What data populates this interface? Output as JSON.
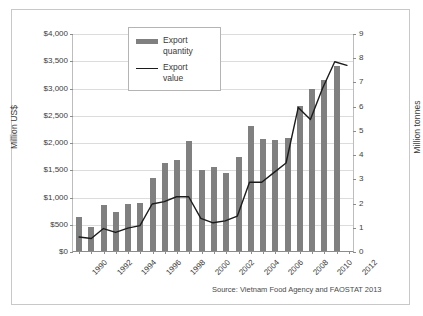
{
  "figure": {
    "source_note": "Source: Vietnam Food Agency and FAOSTAT 2013",
    "border_color": "#c8c8c8",
    "background": "#ffffff"
  },
  "legend": {
    "position": "inside-top-center-left",
    "items": [
      {
        "label_line1": "Export",
        "label_line2": "quantity",
        "marker": "bar-swatch-icon",
        "color": "#808080"
      },
      {
        "label_line1": "Export",
        "label_line2": "value",
        "marker": "line-swatch-icon",
        "color": "#1c1c1c"
      }
    ]
  },
  "chart_data": {
    "type": "bar",
    "title": "",
    "subtitle": "",
    "xlabel": "",
    "ylabel": "Million US$",
    "y2label": "Million tonnes",
    "grid": true,
    "legend_position": "inside upper center-left",
    "x": [
      1990,
      1991,
      1992,
      1993,
      1994,
      1995,
      1996,
      1997,
      1998,
      1999,
      2000,
      2001,
      2002,
      2003,
      2004,
      2005,
      2006,
      2007,
      2008,
      2009,
      2010,
      2011,
      2012
    ],
    "categories": [
      "1990",
      "1991",
      "1992",
      "1993",
      "1994",
      "1995",
      "1996",
      "1997",
      "1998",
      "1999",
      "2000",
      "2001",
      "2002",
      "2003",
      "2004",
      "2005",
      "2006",
      "2007",
      "2008",
      "2009",
      "2010",
      "2011",
      "2012"
    ],
    "xtick_labels": [
      "1990",
      "1992",
      "1994",
      "1996",
      "1998",
      "2000",
      "2002",
      "2004",
      "2006",
      "2008",
      "2010",
      "2012"
    ],
    "ylim": [
      0,
      4000
    ],
    "yticks": [
      0,
      500,
      1000,
      1500,
      2000,
      2500,
      3000,
      3500,
      4000
    ],
    "ytick_labels": [
      "$0",
      "$500",
      "$1,000",
      "$1,500",
      "$2,000",
      "$2,500",
      "$3,000",
      "$3,500",
      "$4,000"
    ],
    "y2lim": [
      0,
      9
    ],
    "y2ticks": [
      0,
      1,
      2,
      3,
      4,
      5,
      6,
      7,
      8,
      9
    ],
    "y2tick_labels": [
      "0",
      "1",
      "2",
      "3",
      "4",
      "5",
      "6",
      "7",
      "8",
      "9"
    ],
    "series": [
      {
        "name": "Export quantity",
        "type": "bar",
        "axis": "left",
        "unit": "Million US$",
        "color": "#808080",
        "values": [
          630,
          435,
          840,
          720,
          870,
          890,
          1340,
          1620,
          1670,
          2010,
          1490,
          1550,
          1430,
          1720,
          2300,
          2050,
          2030,
          2080,
          2670,
          2980,
          3130,
          3400,
          0
        ]
      },
      {
        "name": "Export value",
        "type": "line",
        "axis": "right",
        "unit": "Million tonnes",
        "color": "#1c1c1c",
        "values": [
          0.58,
          0.52,
          0.93,
          0.77,
          0.95,
          1.05,
          1.95,
          2.05,
          2.25,
          2.25,
          1.35,
          1.17,
          1.25,
          1.45,
          2.85,
          2.85,
          3.25,
          3.65,
          5.95,
          5.45,
          6.75,
          7.85,
          7.7
        ]
      }
    ]
  }
}
